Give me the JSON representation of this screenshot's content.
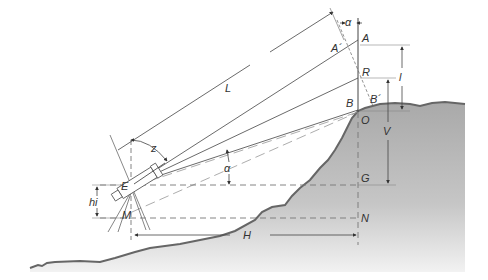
{
  "figure": {
    "labels": {
      "alpha_top": "α",
      "A": "A",
      "A_prime": "A´",
      "R": "R",
      "B": "B",
      "B_prime": "B´",
      "O": "O",
      "G": "G",
      "N": "N",
      "E": "E",
      "M": "M",
      "L": "L",
      "z": "z",
      "alpha_mid": "α",
      "hi": "hi",
      "l": "l",
      "V": "V",
      "H": "H"
    },
    "colors": {
      "ground_fill": "#b8b8b8",
      "ground_line": "#666666",
      "line": "#444444",
      "background": "#ffffff"
    }
  }
}
